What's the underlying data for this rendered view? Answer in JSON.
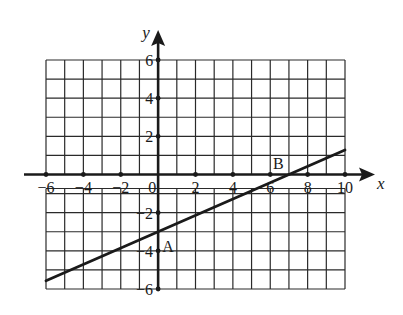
{
  "chart_data": {
    "type": "line",
    "title": "",
    "xlabel": "x",
    "ylabel": "y",
    "xlim": [
      -6,
      10
    ],
    "ylim": [
      -6,
      6
    ],
    "grid": true,
    "grid_step": 1,
    "x_ticks": [
      -6,
      -4,
      -2,
      0,
      2,
      4,
      6,
      8,
      10
    ],
    "x_tick_labels": [
      "−6",
      "−4",
      "−2",
      "0",
      "2",
      "4",
      "6",
      "8",
      "10"
    ],
    "y_ticks": [
      6,
      4,
      2,
      -2,
      -4,
      -6
    ],
    "y_tick_labels": [
      "6",
      "4",
      "2",
      "−2",
      "−4",
      "−6"
    ],
    "series": [
      {
        "name": "line AB",
        "points": [
          [
            -6,
            -5.571
          ],
          [
            0,
            -3
          ],
          [
            7,
            0
          ],
          [
            10,
            1.286
          ]
        ],
        "equation": "y = (3/7)x - 3"
      }
    ],
    "annotations": [
      {
        "label": "A",
        "x": 0,
        "y": -3
      },
      {
        "label": "B",
        "x": 7,
        "y": 0
      }
    ]
  },
  "style": {
    "ink": "#1a1a1a",
    "grid": "#2a2a2a",
    "background": "#ffffff"
  }
}
